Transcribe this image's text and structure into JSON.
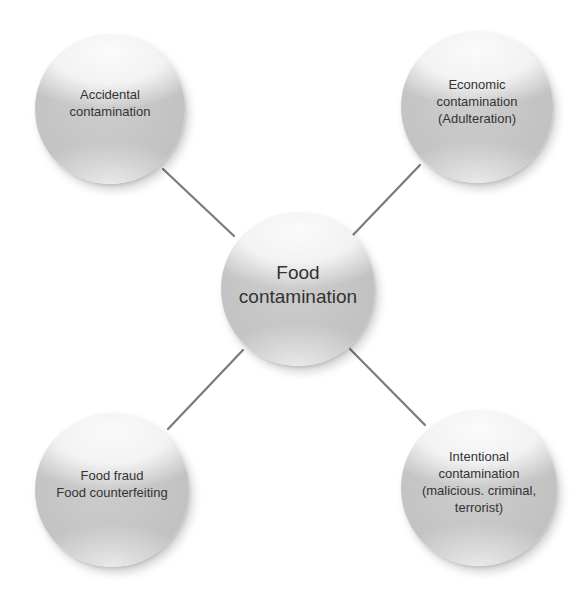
{
  "diagram": {
    "center": {
      "label": "Food\ncontamination",
      "x": 298,
      "y": 289,
      "r": 77
    },
    "nodes": [
      {
        "id": "accidental",
        "label": "Accidental\ncontamination",
        "x": 110,
        "y": 109,
        "r": 75
      },
      {
        "id": "economic",
        "label": "Economic\ncontamination\n(Adulteration)",
        "x": 477,
        "y": 107,
        "r": 76
      },
      {
        "id": "fraud",
        "label": "Food fraud\nFood counterfeiting",
        "x": 112,
        "y": 490,
        "r": 77
      },
      {
        "id": "intentional",
        "label": "Intentional\ncontamination\n(malicious. criminal,\nterrorist)",
        "x": 479,
        "y": 488,
        "r": 78
      }
    ],
    "connectors": [
      {
        "from": "center",
        "to": "accidental",
        "x1": 234,
        "y1": 236,
        "x2": 163,
        "y2": 169
      },
      {
        "from": "center",
        "to": "economic",
        "x1": 353,
        "y1": 235,
        "x2": 420,
        "y2": 165
      },
      {
        "from": "center",
        "to": "fraud",
        "x1": 243,
        "y1": 350,
        "x2": 168,
        "y2": 429
      },
      {
        "from": "center",
        "to": "intentional",
        "x1": 350,
        "y1": 349,
        "x2": 425,
        "y2": 425
      }
    ],
    "colors": {
      "node_fill": "#c4c4c4",
      "node_highlight": "#ececec",
      "text": "#333333",
      "connector": "#7a7a7a",
      "background": "#ffffff"
    }
  }
}
